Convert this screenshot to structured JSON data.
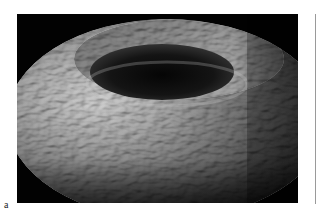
{
  "figure": {
    "panel_label": "a",
    "image_description": "Rendered textured torus (bumpy surface) on black background",
    "colors": {
      "background": "#020202",
      "surface_highlight": "#e8e8e8",
      "surface_mid": "#8a8a8a",
      "surface_shadow": "#1a1a1a"
    }
  }
}
